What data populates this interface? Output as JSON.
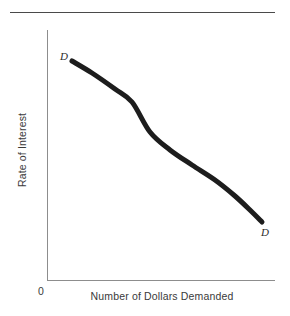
{
  "figure": {
    "divider_color": "#4a4a4a",
    "axis_color": "#8d8d8d",
    "curve_color": "#1d1d1d",
    "background": "#ffffff"
  },
  "labels": {
    "y_axis_title": "Rate of Interest",
    "x_axis_title": "Number of Dollars Demanded",
    "origin": "0",
    "curve_tag_top": "D",
    "curve_tag_bottom": "D"
  },
  "chart_data": {
    "type": "line",
    "title": "",
    "subtitle": "",
    "xlabel": "Number of Dollars Demanded",
    "ylabel": "Rate of Interest",
    "grid": false,
    "legend": null,
    "xlim": [
      0,
      1
    ],
    "ylim": [
      0,
      1
    ],
    "axis_ticks": {
      "x": [
        "0"
      ],
      "y": []
    },
    "annotations": [
      {
        "text": "D",
        "x": 0.11,
        "y": 0.875,
        "style": "italic",
        "position": "upper-left-endpoint"
      },
      {
        "text": "D",
        "x": 0.94,
        "y": 0.2,
        "style": "italic",
        "position": "lower-right-endpoint"
      }
    ],
    "series": [
      {
        "name": "D",
        "description": "Demand curve for loanable funds: downward sloping from upper-left to lower-right",
        "x": [
          0.11,
          0.2,
          0.3,
          0.4,
          0.46,
          0.55,
          0.65,
          0.745,
          0.83,
          0.9,
          0.945
        ],
        "y": [
          0.876,
          0.828,
          0.764,
          0.69,
          0.64,
          0.576,
          0.508,
          0.432,
          0.352,
          0.276,
          0.232
        ],
        "pixel_path": [
          [
            72,
            61
          ],
          [
            92,
            73
          ],
          [
            115,
            89
          ],
          [
            132,
            102
          ],
          [
            150,
            132
          ],
          [
            170,
            150
          ],
          [
            192,
            165
          ],
          [
            215,
            180
          ],
          [
            235,
            196
          ],
          [
            252,
            212
          ],
          [
            262,
            222
          ]
        ],
        "line_width": 5,
        "color": "#1d1d1d",
        "markers": false
      }
    ]
  }
}
